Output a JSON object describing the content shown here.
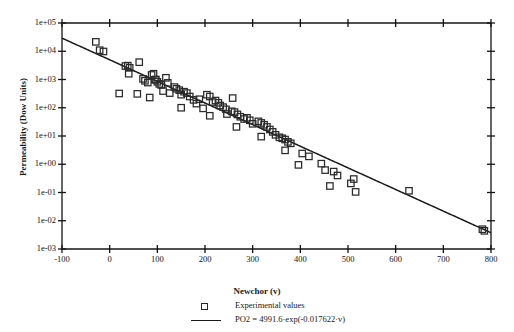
{
  "chart_data": {
    "type": "scatter",
    "title": "",
    "xlabel": "Newchor (v)",
    "ylabel": "Permeability (Dow Units)",
    "xlim": [
      -100,
      800
    ],
    "ylim": [
      0.001,
      100000
    ],
    "yscale": "log",
    "xscale": "linear",
    "grid": false,
    "xticks": [
      -100,
      0,
      100,
      200,
      300,
      400,
      500,
      600,
      700,
      800
    ],
    "xtick_labels": [
      "-100",
      "0",
      "100",
      "200",
      "300",
      "400",
      "500",
      "600",
      "700",
      "800"
    ],
    "yticks": [
      0.001,
      0.01,
      0.1,
      1,
      10,
      100,
      1000,
      10000,
      100000
    ],
    "ytick_labels": [
      "1e-03",
      "1e-02",
      "1e-01",
      "1e+00",
      "1e+01",
      "1e+02",
      "1e+03",
      "1e+04",
      "1e+05"
    ],
    "legend_position": "below-axes",
    "series": [
      {
        "name": "Experimental values",
        "type": "scatter",
        "marker": "open-square",
        "color": "#2a2a2a",
        "points": [
          [
            -29,
            21500
          ],
          [
            -21,
            10900
          ],
          [
            -13,
            9800
          ],
          [
            33,
            3000
          ],
          [
            38,
            3100
          ],
          [
            40,
            1600
          ],
          [
            42,
            2600
          ],
          [
            20,
            320
          ],
          [
            62,
            4100
          ],
          [
            70,
            1050
          ],
          [
            74,
            900
          ],
          [
            80,
            780
          ],
          [
            88,
            1450
          ],
          [
            92,
            1600
          ],
          [
            95,
            980
          ],
          [
            97,
            1000
          ],
          [
            100,
            830
          ],
          [
            104,
            700
          ],
          [
            108,
            640
          ],
          [
            112,
            390
          ],
          [
            118,
            1150
          ],
          [
            122,
            760
          ],
          [
            126,
            330
          ],
          [
            58,
            310
          ],
          [
            84,
            230
          ],
          [
            136,
            540
          ],
          [
            140,
            470
          ],
          [
            146,
            420
          ],
          [
            150,
            290
          ],
          [
            156,
            370
          ],
          [
            162,
            330
          ],
          [
            168,
            250
          ],
          [
            176,
            190
          ],
          [
            182,
            140
          ],
          [
            188,
            200
          ],
          [
            150,
            100
          ],
          [
            196,
            95
          ],
          [
            204,
            290
          ],
          [
            210,
            250
          ],
          [
            216,
            160
          ],
          [
            222,
            180
          ],
          [
            228,
            150
          ],
          [
            232,
            120
          ],
          [
            238,
            105
          ],
          [
            244,
            88
          ],
          [
            210,
            52
          ],
          [
            246,
            60
          ],
          [
            256,
            75
          ],
          [
            262,
            70
          ],
          [
            268,
            58
          ],
          [
            274,
            48
          ],
          [
            282,
            40
          ],
          [
            288,
            44
          ],
          [
            294,
            36
          ],
          [
            266,
            21
          ],
          [
            300,
            27
          ],
          [
            258,
            220
          ],
          [
            312,
            33
          ],
          [
            318,
            29
          ],
          [
            324,
            25
          ],
          [
            330,
            21
          ],
          [
            336,
            17
          ],
          [
            342,
            14
          ],
          [
            318,
            9.5
          ],
          [
            348,
            11
          ],
          [
            356,
            9.0
          ],
          [
            362,
            8.3
          ],
          [
            368,
            7.5
          ],
          [
            374,
            6.2
          ],
          [
            380,
            5.5
          ],
          [
            368,
            3.1
          ],
          [
            404,
            2.4
          ],
          [
            418,
            1.9
          ],
          [
            396,
            0.95
          ],
          [
            444,
            1.05
          ],
          [
            452,
            0.62
          ],
          [
            470,
            0.55
          ],
          [
            478,
            0.4
          ],
          [
            462,
            0.17
          ],
          [
            506,
            0.21
          ],
          [
            512,
            0.3
          ],
          [
            516,
            0.105
          ],
          [
            628,
            0.115
          ],
          [
            782,
            0.005
          ],
          [
            786,
            0.0044
          ]
        ]
      },
      {
        "name": "PO2 = 4991.6·exp(-0.017622·v)",
        "type": "line",
        "color": "#1a1a1a",
        "equation": {
          "form": "exponential",
          "amplitude": 4991.6,
          "rate": -0.017622
        }
      }
    ]
  },
  "axes": {
    "y_title": "Permeability (Dow Units)",
    "x_title": "Newchor (v)"
  },
  "legend": {
    "entries": [
      {
        "label": "Experimental values",
        "marker": "open-square"
      },
      {
        "label": "PO2 = 4991.6·exp(-0.017622·v)",
        "marker": "line"
      }
    ]
  }
}
